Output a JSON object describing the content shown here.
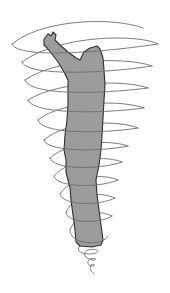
{
  "illustration": {
    "subject": "human figure with raised arm inside a tornado-like spiral",
    "colors": {
      "background": "#ffffff",
      "figure_fill": "#9c9c9c",
      "figure_outline": "#2e2e2e",
      "spiral_stroke": "#6e6e6e"
    },
    "spiral_loops": 11,
    "caption": ""
  }
}
